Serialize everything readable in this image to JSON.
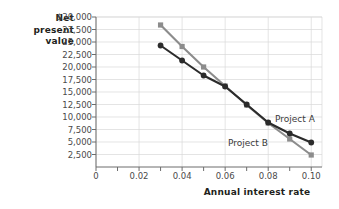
{
  "chart_data": {
    "type": "line",
    "title": "",
    "xlabel": "Annual interest rate",
    "ylabel": "Net present value",
    "ylabel_lines": [
      "Net",
      "present",
      "value"
    ],
    "x": [
      0.03,
      0.04,
      0.05,
      0.06,
      0.07,
      0.08,
      0.09,
      0.1
    ],
    "xlim": [
      0,
      0.105
    ],
    "ylim": [
      0,
      30000
    ],
    "grid": true,
    "legend_position": "inline-annotation",
    "xticks": [
      {
        "value": 0,
        "label": "0"
      },
      {
        "value": 0.01,
        "label": ""
      },
      {
        "value": 0.02,
        "label": "0.02"
      },
      {
        "value": 0.03,
        "label": ""
      },
      {
        "value": 0.04,
        "label": "0.04"
      },
      {
        "value": 0.05,
        "label": ""
      },
      {
        "value": 0.06,
        "label": "0.06"
      },
      {
        "value": 0.07,
        "label": ""
      },
      {
        "value": 0.08,
        "label": "0.08"
      },
      {
        "value": 0.09,
        "label": ""
      },
      {
        "value": 0.1,
        "label": "0.10"
      }
    ],
    "yticks": [
      {
        "value": 30000,
        "label": "$30,000"
      },
      {
        "value": 27500,
        "label": "27,500"
      },
      {
        "value": 25000,
        "label": "25,000"
      },
      {
        "value": 22500,
        "label": "22,500"
      },
      {
        "value": 20000,
        "label": "20,000"
      },
      {
        "value": 17500,
        "label": "17,500"
      },
      {
        "value": 15000,
        "label": "15,000"
      },
      {
        "value": 12500,
        "label": "12,500"
      },
      {
        "value": 10000,
        "label": "10,000"
      },
      {
        "value": 7500,
        "label": "7,500"
      },
      {
        "value": 5000,
        "label": "5,000"
      },
      {
        "value": 2500,
        "label": "2,500"
      }
    ],
    "series": [
      {
        "name": "Project A",
        "color": "#2b2b2b",
        "marker": "circle",
        "values": [
          24300,
          21300,
          18300,
          16100,
          12500,
          8900,
          6700,
          4900
        ]
      },
      {
        "name": "Project B",
        "color": "#8c8c8c",
        "marker": "square",
        "values": [
          28400,
          24100,
          20000,
          16200,
          12400,
          8800,
          5600,
          2400
        ]
      }
    ],
    "annotations": [
      {
        "text": "Project A",
        "series": "Project A"
      },
      {
        "text": "Project B",
        "series": "Project B"
      }
    ]
  },
  "colors": {
    "series_a": "#2b2b2b",
    "series_b": "#8c8c8c",
    "axis": "#6d6d6d",
    "grid": "#d8d8d8",
    "text": "#4a4a4a",
    "title_text": "#231f20",
    "background": "#ffffff"
  }
}
